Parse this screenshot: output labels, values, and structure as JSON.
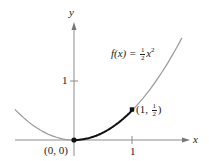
{
  "chart_data": {
    "type": "line",
    "title": "",
    "xlabel": "x",
    "ylabel": "y",
    "function_label": {
      "name": "f(x) = ",
      "coef_num": "1",
      "coef_den": "2",
      "var": "x",
      "exp": "2"
    },
    "x_ticks": [
      {
        "value": 1,
        "label": "1"
      }
    ],
    "y_ticks": [
      {
        "value": 1,
        "label": "1"
      }
    ],
    "xlim": [
      -1.02,
      1.95
    ],
    "ylim": [
      0,
      2.2
    ],
    "grid": false,
    "series": [
      {
        "name": "f(x) = 1/2 x^2",
        "x": [
          -1.0,
          -0.5,
          0,
          0.5,
          1.0,
          1.5,
          1.86
        ],
        "y": [
          0.5,
          0.125,
          0,
          0.125,
          0.5,
          1.125,
          1.73
        ],
        "style": "gray"
      },
      {
        "name": "highlighted arc",
        "x": [
          0,
          0.25,
          0.5,
          0.75,
          1.0
        ],
        "y": [
          0,
          0.031,
          0.125,
          0.281,
          0.5
        ],
        "style": "black-bold"
      }
    ],
    "points": [
      {
        "x": 0,
        "y": 0,
        "label": "(0, 0)"
      },
      {
        "x": 1,
        "y": 0.5,
        "label_open": "(1, ",
        "num": "1",
        "den": "2",
        "label_close": ")"
      }
    ]
  },
  "colors": {
    "curve": "#9a9a9a",
    "highlight": "#111111",
    "axis": "#8c8c8c"
  }
}
